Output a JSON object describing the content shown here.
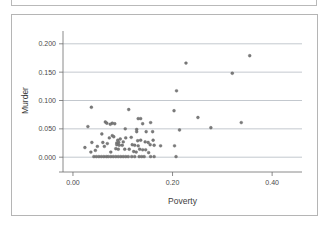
{
  "title_panel": {
    "text": "",
    "visible": true
  },
  "chart_data": {
    "type": "scatter",
    "title": "",
    "xlabel": "Poverty",
    "ylabel": "Murder",
    "xlim": [
      -0.02,
      0.46
    ],
    "ylim": [
      -0.012,
      0.212
    ],
    "xticks": [
      0.0,
      0.2,
      0.4
    ],
    "xticklabels": [
      "0.00",
      "0.20",
      "0.40"
    ],
    "yticks": [
      0.0,
      0.05,
      0.1,
      0.15,
      0.2
    ],
    "yticklabels": [
      "0.000",
      "0.050",
      "0.100",
      "0.150",
      "0.200"
    ],
    "grid": "horizontal",
    "legend": null,
    "marker_color": "#7b7b7b",
    "marker_edge_color": "#5e5e5e",
    "points": [
      [
        0.355,
        0.179
      ],
      [
        0.227,
        0.166
      ],
      [
        0.32,
        0.148
      ],
      [
        0.208,
        0.117
      ],
      [
        0.037,
        0.088
      ],
      [
        0.203,
        0.082
      ],
      [
        0.112,
        0.084
      ],
      [
        0.251,
        0.07
      ],
      [
        0.131,
        0.068
      ],
      [
        0.136,
        0.068
      ],
      [
        0.065,
        0.062
      ],
      [
        0.079,
        0.06
      ],
      [
        0.084,
        0.059
      ],
      [
        0.075,
        0.058
      ],
      [
        0.338,
        0.061
      ],
      [
        0.156,
        0.061
      ],
      [
        0.068,
        0.06
      ],
      [
        0.14,
        0.059
      ],
      [
        0.277,
        0.052
      ],
      [
        0.03,
        0.054
      ],
      [
        0.214,
        0.048
      ],
      [
        0.105,
        0.05
      ],
      [
        0.128,
        0.049
      ],
      [
        0.16,
        0.045
      ],
      [
        0.147,
        0.045
      ],
      [
        0.128,
        0.045
      ],
      [
        0.058,
        0.041
      ],
      [
        0.079,
        0.038
      ],
      [
        0.082,
        0.036
      ],
      [
        0.073,
        0.034
      ],
      [
        0.106,
        0.034
      ],
      [
        0.117,
        0.035
      ],
      [
        0.09,
        0.03
      ],
      [
        0.095,
        0.032
      ],
      [
        0.136,
        0.03
      ],
      [
        0.161,
        0.03
      ],
      [
        0.13,
        0.029
      ],
      [
        0.101,
        0.027
      ],
      [
        0.092,
        0.026
      ],
      [
        0.088,
        0.025
      ],
      [
        0.145,
        0.027
      ],
      [
        0.151,
        0.026
      ],
      [
        0.06,
        0.026
      ],
      [
        0.038,
        0.026
      ],
      [
        0.069,
        0.024
      ],
      [
        0.088,
        0.022
      ],
      [
        0.093,
        0.021
      ],
      [
        0.099,
        0.021
      ],
      [
        0.119,
        0.022
      ],
      [
        0.124,
        0.021
      ],
      [
        0.131,
        0.02
      ],
      [
        0.155,
        0.022
      ],
      [
        0.163,
        0.021
      ],
      [
        0.176,
        0.02
      ],
      [
        0.204,
        0.02
      ],
      [
        0.049,
        0.019
      ],
      [
        0.063,
        0.019
      ],
      [
        0.024,
        0.017
      ],
      [
        0.086,
        0.015
      ],
      [
        0.091,
        0.014
      ],
      [
        0.104,
        0.014
      ],
      [
        0.113,
        0.014
      ],
      [
        0.134,
        0.014
      ],
      [
        0.14,
        0.013
      ],
      [
        0.146,
        0.013
      ],
      [
        0.045,
        0.012
      ],
      [
        0.036,
        0.009
      ],
      [
        0.076,
        0.009
      ],
      [
        0.122,
        0.01
      ],
      [
        0.127,
        0.009
      ],
      [
        0.152,
        0.008
      ],
      [
        0.042,
        0.001
      ],
      [
        0.047,
        0.001
      ],
      [
        0.052,
        0.001
      ],
      [
        0.057,
        0.001
      ],
      [
        0.062,
        0.001
      ],
      [
        0.067,
        0.001
      ],
      [
        0.071,
        0.001
      ],
      [
        0.076,
        0.001
      ],
      [
        0.081,
        0.001
      ],
      [
        0.086,
        0.001
      ],
      [
        0.091,
        0.001
      ],
      [
        0.096,
        0.001
      ],
      [
        0.101,
        0.001
      ],
      [
        0.106,
        0.001
      ],
      [
        0.111,
        0.001
      ],
      [
        0.118,
        0.001
      ],
      [
        0.124,
        0.001
      ],
      [
        0.133,
        0.001
      ],
      [
        0.138,
        0.001
      ],
      [
        0.143,
        0.001
      ],
      [
        0.156,
        0.001
      ],
      [
        0.163,
        0.001
      ],
      [
        0.207,
        0.001
      ]
    ]
  }
}
